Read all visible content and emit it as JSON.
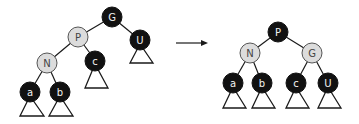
{
  "diagram": {
    "type": "red-black-tree-rotation",
    "before": {
      "nodes": [
        {
          "id": "G",
          "label": "G",
          "color": "black"
        },
        {
          "id": "P",
          "label": "P",
          "color": "red"
        },
        {
          "id": "U",
          "label": "U",
          "color": "black"
        },
        {
          "id": "N",
          "label": "N",
          "color": "red"
        },
        {
          "id": "c",
          "label": "c",
          "color": "black"
        },
        {
          "id": "a",
          "label": "a",
          "color": "black"
        },
        {
          "id": "b",
          "label": "b",
          "color": "black"
        }
      ],
      "edges": [
        [
          "G",
          "P"
        ],
        [
          "G",
          "U"
        ],
        [
          "P",
          "N"
        ],
        [
          "P",
          "c"
        ],
        [
          "N",
          "a"
        ],
        [
          "N",
          "b"
        ]
      ],
      "subtrees_under": [
        "U",
        "c",
        "a",
        "b"
      ]
    },
    "arrow": "right",
    "after": {
      "nodes": [
        {
          "id": "P",
          "label": "P",
          "color": "black"
        },
        {
          "id": "N",
          "label": "N",
          "color": "red"
        },
        {
          "id": "G",
          "label": "G",
          "color": "red"
        },
        {
          "id": "a",
          "label": "a",
          "color": "black"
        },
        {
          "id": "b",
          "label": "b",
          "color": "black"
        },
        {
          "id": "c",
          "label": "c",
          "color": "black"
        },
        {
          "id": "U",
          "label": "U",
          "color": "black"
        }
      ],
      "edges": [
        [
          "P",
          "N"
        ],
        [
          "P",
          "G"
        ],
        [
          "N",
          "a"
        ],
        [
          "N",
          "b"
        ],
        [
          "G",
          "c"
        ],
        [
          "G",
          "U"
        ]
      ],
      "subtrees_under": [
        "a",
        "b",
        "c",
        "U"
      ]
    },
    "colors": {
      "black_node": "#111111",
      "red_node_fill": "#dcdcdc",
      "line": "#1a1a1a"
    }
  }
}
